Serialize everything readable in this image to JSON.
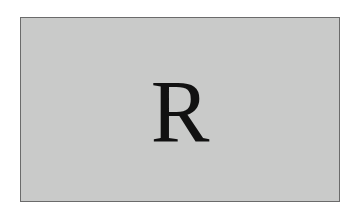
{
  "card": {
    "letter": "R",
    "background_color": "#c9cac9",
    "border_color": "#6b6b6b",
    "text_color": "#111111"
  }
}
